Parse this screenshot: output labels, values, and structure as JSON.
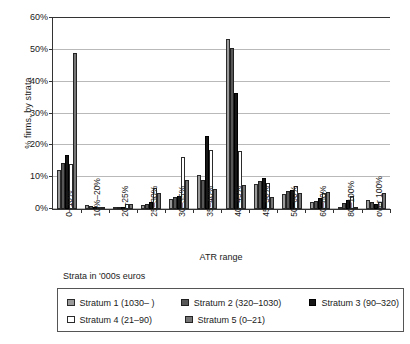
{
  "chart_data": {
    "type": "bar",
    "title": "",
    "xlabel": "ATR range",
    "ylabel": "% firms, by strata",
    "ylim": [
      0,
      60
    ],
    "y_ticks": [
      0,
      10,
      20,
      30,
      40,
      50,
      60
    ],
    "y_tick_labels": [
      "0%",
      "10%",
      "20%",
      "30%",
      "40%",
      "50%",
      "60%"
    ],
    "grid": true,
    "legend_position": "bottom",
    "categories": [
      "0–10%",
      "10%–20%",
      "20–25%",
      "25–30%",
      "30–35%",
      "35–40%",
      "40–45%",
      "45–50%",
      "50–60%",
      "60–80%",
      "80–100%",
      "over 100%"
    ],
    "series": [
      {
        "name": "Stratum 1 (1030– )",
        "key": "s1",
        "color": "#9a9a9a",
        "values": [
          12.2,
          1.1,
          0.6,
          1.3,
          3.0,
          10.7,
          53.2,
          7.7,
          4.8,
          2.1,
          0.7,
          2.7
        ]
      },
      {
        "name": "Stratum 2 (320–1030)",
        "key": "s2",
        "color": "#575757",
        "values": [
          14.5,
          0.9,
          0.7,
          1.6,
          3.6,
          9.0,
          50.3,
          8.6,
          5.5,
          2.4,
          1.9,
          2.3
        ]
      },
      {
        "name": "Stratum 3 (90–320)",
        "key": "s3",
        "color": "#161616",
        "values": [
          16.9,
          0.6,
          0.5,
          2.1,
          4.2,
          22.8,
          36.3,
          9.7,
          5.8,
          3.4,
          2.7,
          1.7
        ]
      },
      {
        "name": "Stratum 4 (21–90)",
        "key": "s4",
        "color": "#ffffff",
        "values": [
          14.1,
          0.7,
          1.5,
          6.7,
          16.3,
          18.5,
          18.2,
          8.2,
          7.1,
          4.9,
          4.1,
          2.3
        ]
      },
      {
        "name": "Stratum 5 (0–21)",
        "key": "s5",
        "color": "#757575",
        "values": [
          48.7,
          0.6,
          1.5,
          5.0,
          9.0,
          6.2,
          7.5,
          3.8,
          4.9,
          5.2,
          0.0,
          5.0
        ]
      }
    ]
  },
  "axis": {
    "y_title": "% firms, by strata",
    "x_title": "ATR range"
  },
  "caption": {
    "strata_note": "Strata in '000s euros"
  },
  "legend": {
    "rows": [
      [
        {
          "label": "Stratum 1 (1030– )",
          "key": "s1"
        },
        {
          "label": "Stratum 2 (320–1030)",
          "key": "s2"
        },
        {
          "label": "Stratum 3 (90–320)",
          "key": "s3"
        }
      ],
      [
        {
          "label": "Stratum 4 (21–90)",
          "key": "s4"
        },
        {
          "label": "Stratum 5 (0–21)",
          "key": "s5"
        }
      ]
    ]
  }
}
